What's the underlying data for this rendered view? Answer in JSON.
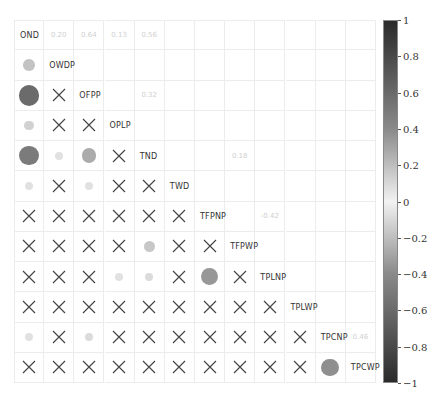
{
  "chart_data": {
    "type": "heatmap",
    "subtype": "correlation-matrix-circle-lower-number-upper",
    "title": "",
    "variables": [
      "OND",
      "OWDP",
      "OFPP",
      "OPLP",
      "TND",
      "TWD",
      "TFPNP",
      "TFPWP",
      "TPLNP",
      "TPLWP",
      "TPCNP",
      "TPCWP"
    ],
    "colorbar": {
      "min": -1,
      "max": 1,
      "ticks": [
        "1",
        "0.8",
        "0.6",
        "0.4",
        "0.2",
        "0",
        "−0.2",
        "−0.4",
        "−0.6",
        "−0.8",
        "−1"
      ]
    },
    "significant_correlations": [
      {
        "row": "OWDP",
        "col": "OND",
        "value": 0.2
      },
      {
        "row": "OFPP",
        "col": "OND",
        "value": 0.64
      },
      {
        "row": "OPLP",
        "col": "OND",
        "value": 0.13
      },
      {
        "row": "TND",
        "col": "OND",
        "value": 0.56
      },
      {
        "row": "TND",
        "col": "OWDP",
        "value": 0.05
      },
      {
        "row": "TND",
        "col": "OFPP",
        "value": 0.32
      },
      {
        "row": "TWD",
        "col": "OND",
        "value": 0.05
      },
      {
        "row": "TWD",
        "col": "OFPP",
        "value": 0.05
      },
      {
        "row": "TFPWP",
        "col": "TND",
        "value": 0.18
      },
      {
        "row": "TPLNP",
        "col": "OPLP",
        "value": 0.05
      },
      {
        "row": "TPLNP",
        "col": "TND",
        "value": 0.08
      },
      {
        "row": "TPLNP",
        "col": "TFPNP",
        "value": -0.42
      },
      {
        "row": "TPCNP",
        "col": "OND",
        "value": 0.05
      },
      {
        "row": "TPCNP",
        "col": "OFPP",
        "value": 0.08
      },
      {
        "row": "TPCWP",
        "col": "TPCNP",
        "value": 0.46
      }
    ],
    "upper_triangle_labels": [
      {
        "row": 0,
        "col": 1,
        "text": "0.20"
      },
      {
        "row": 0,
        "col": 2,
        "text": "0.64"
      },
      {
        "row": 0,
        "col": 3,
        "text": "0.13"
      },
      {
        "row": 0,
        "col": 4,
        "text": "0.56"
      },
      {
        "row": 2,
        "col": 4,
        "text": "0.32"
      },
      {
        "row": 4,
        "col": 7,
        "text": "0.18"
      },
      {
        "row": 6,
        "col": 8,
        "text": "-0.42"
      },
      {
        "row": 10,
        "col": 11,
        "text": "0.46"
      }
    ],
    "nonsignificant_marker": "X"
  }
}
